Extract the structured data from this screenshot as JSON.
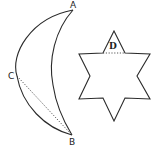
{
  "figure": {
    "crescent": {
      "labels": {
        "a": "A",
        "b": "B",
        "c": "C"
      },
      "chord": "C to B (dotted)"
    },
    "star": {
      "labels": {
        "d": "D"
      },
      "chord": "dotted line across top point base"
    },
    "colors": {
      "line": "#2a2a2a",
      "background": "#ffffff"
    }
  }
}
